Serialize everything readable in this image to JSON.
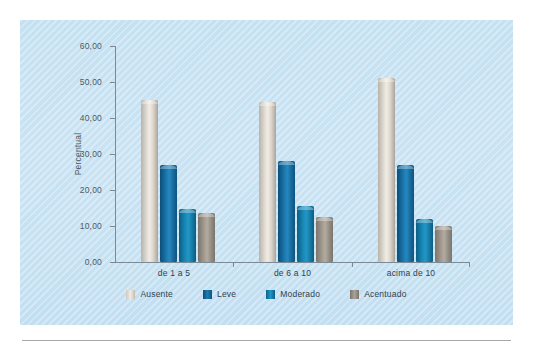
{
  "chart_data": {
    "type": "bar",
    "title": "",
    "xlabel": "",
    "ylabel": "Percentual",
    "categories": [
      "de 1 a 5",
      "de 6 a 10",
      "acima de 10"
    ],
    "series": [
      {
        "name": "Ausente",
        "color": "#e3ded6",
        "values": [
          45.0,
          44.5,
          51.0
        ]
      },
      {
        "name": "Leve",
        "color": "#1d7cb3",
        "values": [
          27.0,
          28.0,
          27.0
        ]
      },
      {
        "name": "Moderado",
        "color": "#2296c6",
        "values": [
          14.8,
          15.5,
          12.0
        ]
      },
      {
        "name": "Acentuado",
        "color": "#a79f94",
        "values": [
          13.5,
          12.5,
          10.0
        ]
      }
    ],
    "ylim": [
      0,
      60
    ],
    "ytick_values": [
      0,
      10,
      20,
      30,
      40,
      50,
      60
    ],
    "ytick_labels": [
      "0,00",
      "10,00",
      "20,00",
      "30,00",
      "40,00",
      "50,00",
      "60,00"
    ],
    "grid": false,
    "legend_position": "bottom"
  },
  "legend": {
    "items": [
      {
        "label": "Ausente"
      },
      {
        "label": "Leve"
      },
      {
        "label": "Moderado"
      },
      {
        "label": "Acentuado"
      }
    ]
  }
}
